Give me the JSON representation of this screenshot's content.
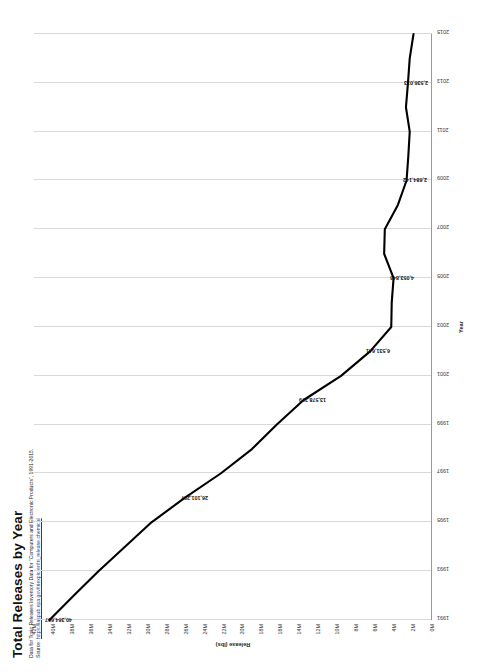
{
  "header": {
    "title": "Total Releases by Year",
    "subtitle": "Data for Toxic Releases Inventory Data for \"Computers and Electronic Products\", 1991-2015.",
    "source_prefix": "Source: ",
    "source_link": "https://iaspub.epa.gov/triexplorer/tri_release.chemical"
  },
  "chart_data": {
    "type": "line",
    "title": "Total Releases by Year",
    "xlabel": "Year",
    "ylabel": "Release (lbs)",
    "grid": "vertical",
    "legend": "none",
    "ylim": [
      0,
      42000000
    ],
    "ytick_labels": [
      "42M",
      "40M",
      "38M",
      "36M",
      "34M",
      "32M",
      "30M",
      "28M",
      "26M",
      "24M",
      "22M",
      "20M",
      "18M",
      "16M",
      "14M",
      "12M",
      "10M",
      "8M",
      "6M",
      "4M",
      "2M",
      "0M"
    ],
    "ytick_values": [
      42000000,
      40000000,
      38000000,
      36000000,
      34000000,
      32000000,
      30000000,
      28000000,
      26000000,
      24000000,
      22000000,
      20000000,
      18000000,
      16000000,
      14000000,
      12000000,
      10000000,
      8000000,
      6000000,
      4000000,
      2000000,
      0
    ],
    "xtick_labels": [
      "1991",
      "1993",
      "1995",
      "1997",
      "1999",
      "2001",
      "2003",
      "2005",
      "2007",
      "2009",
      "2011",
      "2013",
      "2015"
    ],
    "x": [
      1991,
      1992,
      1993,
      1994,
      1995,
      1996,
      1997,
      1998,
      1999,
      2000,
      2001,
      2002,
      2003,
      2004,
      2005,
      2006,
      2007,
      2008,
      2009,
      2010,
      2011,
      2012,
      2013,
      2014,
      2015
    ],
    "values": [
      40364697,
      37800000,
      35200000,
      32400000,
      29600000,
      26101297,
      22300000,
      19000000,
      16400000,
      13578279,
      9600000,
      6531641,
      4300000,
      4250000,
      4053846,
      5050000,
      4980000,
      3600000,
      2684142,
      2500000,
      2350000,
      2750000,
      2536013,
      2350000,
      1950000
    ],
    "point_labels": [
      {
        "year": 1991,
        "value": 40364697,
        "text": "40,364,697"
      },
      {
        "year": 1996,
        "value": 26101297,
        "text": "26,101,297"
      },
      {
        "year": 2000,
        "value": 13578279,
        "text": "13,578,279"
      },
      {
        "year": 2002,
        "value": 6531641,
        "text": "6,531,641"
      },
      {
        "year": 2005,
        "value": 4053846,
        "text": "4,053,846"
      },
      {
        "year": 2009,
        "value": 2684142,
        "text": "2,684,142"
      },
      {
        "year": 2013,
        "value": 2536013,
        "text": "2,536,013"
      }
    ],
    "line_color": "#000000",
    "grid_color": "#d9d9d9"
  }
}
